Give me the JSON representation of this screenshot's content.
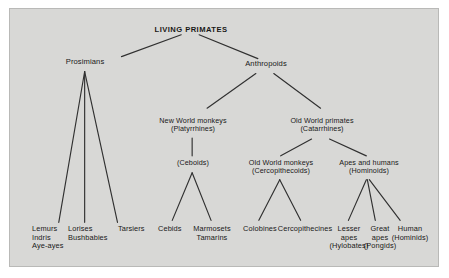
{
  "diagram": {
    "title": "LIVING PRIMATES",
    "panel_bg": "#d8d8d6",
    "panel_border": "#b9b9b7",
    "line_color": "#303030",
    "text_color": "#181818",
    "root": {
      "label": "LIVING PRIMATES"
    },
    "level1": [
      {
        "id": "prosimians",
        "label": "Prosimians"
      },
      {
        "id": "anthropoids",
        "label": "Anthropoids"
      }
    ],
    "level2": [
      {
        "id": "new-world-monkeys",
        "line1": "New World monkeys",
        "line2": "(Platyrrhines)"
      },
      {
        "id": "old-world-primates",
        "line1": "Old World primates",
        "line2": "(Catarrhines)"
      }
    ],
    "level3": [
      {
        "id": "ceboids",
        "line1": "(Ceboids)",
        "line2": ""
      },
      {
        "id": "old-world-monkeys",
        "line1": "Old World monkeys",
        "line2": "(Cercopithecoids)"
      },
      {
        "id": "apes-and-humans",
        "line1": "Apes and humans",
        "line2": "(Hominoids)"
      }
    ],
    "leaves": {
      "prosimian": [
        {
          "id": "lemurs",
          "line1": "Lemurs",
          "line2": "Indris",
          "line3": "Aye-ayes"
        },
        {
          "id": "lorises",
          "line1": "Lorises",
          "line2": "Bushbabies",
          "line3": ""
        },
        {
          "id": "tarsiers",
          "line1": "Tarsiers",
          "line2": "",
          "line3": ""
        }
      ],
      "ceboid": [
        {
          "id": "cebids",
          "line1": "Cebids",
          "line2": "",
          "line3": ""
        },
        {
          "id": "marmosets",
          "line1": "Marmosets",
          "line2": "Tamarins",
          "line3": ""
        }
      ],
      "cercopithecoid": [
        {
          "id": "colobines",
          "line1": "Colobines",
          "line2": "",
          "line3": ""
        },
        {
          "id": "cercopithecines",
          "line1": "Cercopithecines",
          "line2": "",
          "line3": ""
        }
      ],
      "hominoid": [
        {
          "id": "lesser-apes",
          "line1": "Lesser",
          "line2": "apes",
          "line3": "(Hylobates)"
        },
        {
          "id": "great-apes",
          "line1": "Great",
          "line2": "apes",
          "line3": "(Pongids)"
        },
        {
          "id": "human",
          "line1": "Human",
          "line2": "(Hominids)",
          "line3": ""
        }
      ]
    }
  }
}
